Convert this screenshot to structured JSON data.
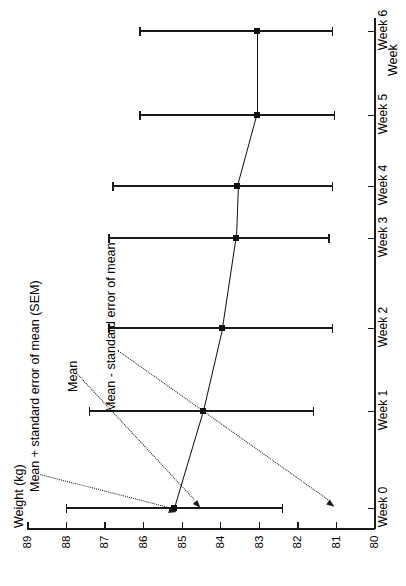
{
  "chart_data": {
    "type": "line",
    "title": "",
    "orientation": "rotated-90",
    "xlabel": "Weight (kg)",
    "ylabel": "Week",
    "categories": [
      "Week 0",
      "Week 1",
      "Week 2",
      "Week 3",
      "Week 4",
      "Week 5",
      "Week 6"
    ],
    "weight_axis_label": "Weight (kg)",
    "weight_ticks": [
      89,
      88,
      87,
      86,
      85,
      84,
      83,
      82,
      81,
      80
    ],
    "weight_axis_range": [
      89,
      80
    ],
    "weight_axis_reversed": true,
    "grid": false,
    "legend": "none",
    "series": [
      {
        "name": "Mean weight",
        "values": [
          85.2,
          84.45,
          83.95,
          83.6,
          83.55,
          83.05,
          83.05
        ],
        "sem_lower": [
          82.4,
          81.6,
          81.1,
          81.2,
          81.1,
          81.05,
          81.1
        ],
        "sem_upper": [
          88.0,
          87.4,
          86.9,
          86.9,
          86.8,
          86.1,
          86.1
        ],
        "marker": "square",
        "color": "#111111"
      }
    ],
    "annotations": [
      {
        "text": "Mean + standard error of mean (SEM)",
        "points_to": "upper-error-bar-cap"
      },
      {
        "text": "Mean",
        "points_to": "mean-marker"
      },
      {
        "text": "Mean - standard error of mean",
        "points_to": "lower-error-bar-cap"
      }
    ]
  },
  "axes": {
    "x_title": "Weight (kg)",
    "y_title": "Week",
    "x_tick_labels": [
      "89",
      "88",
      "87",
      "86",
      "85",
      "84",
      "83",
      "82",
      "81",
      "80"
    ],
    "y_tick_labels": [
      "Week 0",
      "Week 1",
      "Week 2",
      "Week 3",
      "Week 4",
      "Week 5",
      "Week 6"
    ]
  },
  "annotations": {
    "sem_plus": "Mean + standard error of mean (SEM)",
    "mean": "Mean",
    "sem_minus": "Mean - standard error of mean"
  }
}
